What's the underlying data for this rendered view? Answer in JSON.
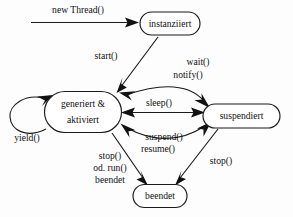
{
  "diagram": {
    "type": "state-diagram",
    "background_color": "#fdfdfd",
    "line_color": "#1a1a1a",
    "text_color": "#111111",
    "states": [
      {
        "id": "instanziiert",
        "label": "instanziiert",
        "lines": [
          "instanziiert"
        ],
        "x": 170,
        "y": 23.5,
        "w": 60,
        "h": 23
      },
      {
        "id": "generiert_aktiviert",
        "label": "generiert & aktiviert",
        "lines": [
          "generiert &",
          "aktiviert"
        ],
        "x": 83,
        "y": 112,
        "w": 77,
        "h": 41
      },
      {
        "id": "suspendiert",
        "label": "suspendiert",
        "lines": [
          "suspendiert"
        ],
        "x": 241,
        "y": 116,
        "w": 77,
        "h": 24
      },
      {
        "id": "beendet",
        "label": "beendet",
        "lines": [
          "beendet"
        ],
        "x": 160,
        "y": 196,
        "w": 54,
        "h": 23
      }
    ],
    "transitions": [
      {
        "id": "new_thread",
        "label": "new Thread()",
        "lines": [
          "new Thread()"
        ],
        "from": "start-point",
        "to": "instanziiert",
        "label_x": 78,
        "label_y": 11
      },
      {
        "id": "start",
        "label": "start()",
        "lines": [
          "start()"
        ],
        "from": "instanziiert",
        "to": "generiert_aktiviert",
        "label_x": 110,
        "label_y": 57
      },
      {
        "id": "wait_notify",
        "label": "wait() notify()",
        "lines": [
          "wait()",
          "notify()"
        ],
        "from": "suspendiert",
        "to": "generiert_aktiviert",
        "label_x": 188,
        "label_y": 70
      },
      {
        "id": "sleep",
        "label": "sleep()",
        "lines": [
          "sleep()"
        ],
        "from": "generiert_aktiviert",
        "to": "suspendiert",
        "label_x": 159,
        "label_y": 104
      },
      {
        "id": "suspend_resume",
        "label": "suspend() resume()",
        "lines": [
          "suspend()",
          "resume()"
        ],
        "from": "generiert_aktiviert",
        "to": "suspendiert",
        "label_x": 163,
        "label_y": 140
      },
      {
        "id": "yield",
        "label": "yield()",
        "lines": [
          "yield()"
        ],
        "from": "generiert_aktiviert",
        "to": "generiert_aktiviert",
        "label_x": 27,
        "label_y": 139
      },
      {
        "id": "stop_or_run_beendet",
        "label": "stop() od. run() beendet",
        "lines": [
          "stop()",
          "od. run()",
          "beendet"
        ],
        "from": "generiert_aktiviert",
        "to": "beendet",
        "label_x": 110,
        "label_y": 166
      },
      {
        "id": "stop_suspended",
        "label": "stop()",
        "lines": [
          "stop()"
        ],
        "from": "suspendiert",
        "to": "beendet",
        "label_x": 218,
        "label_y": 163
      }
    ]
  }
}
